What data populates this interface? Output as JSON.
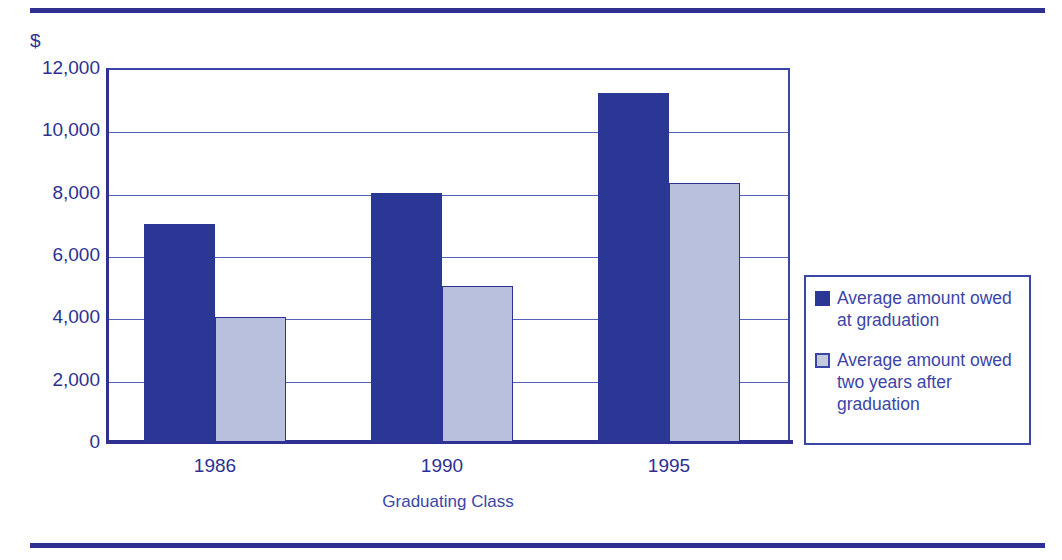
{
  "chart_data": {
    "type": "bar",
    "title": "",
    "subtitle": "",
    "xlabel": "Graduating Class",
    "ylabel": "$",
    "categories": [
      "1986",
      "1990",
      "1995"
    ],
    "series": [
      {
        "name": "Average amount owed at graduation",
        "color": "#2a3795",
        "values": [
          7000,
          8000,
          11200
        ]
      },
      {
        "name": "Average amount owed two years after graduation",
        "color": "#b9c0de",
        "values": [
          4000,
          5000,
          8300
        ]
      }
    ],
    "ylim": [
      0,
      12000
    ],
    "ytick_values": [
      0,
      2000,
      4000,
      6000,
      8000,
      10000,
      12000
    ],
    "ytick_labels": [
      "0",
      "2,000",
      "4,000",
      "6,000",
      "8,000",
      "10,000",
      "12,000"
    ],
    "grid": true,
    "legend_position": "right",
    "bar_mode": "grouped"
  },
  "axes": {
    "y_unit_symbol": "$",
    "x_title": "Graduating Class"
  },
  "legend": {
    "entries": [
      {
        "label": "Average amount owed at graduation",
        "swatch": "dark-blue-swatch"
      },
      {
        "label": "Average amount owed two years after graduation",
        "swatch": "light-blue-swatch"
      }
    ]
  },
  "colors": {
    "accent": "#2e3192",
    "series_dark": "#2a3795",
    "series_light": "#b9c0de",
    "gridline": "#5560b8",
    "text": "#3b45a8"
  }
}
